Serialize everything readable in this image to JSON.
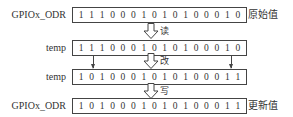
{
  "rows": [
    {
      "label": "GPIOx_ODR",
      "bits": [
        "1",
        "1",
        "1",
        "0",
        "0",
        "0",
        "1",
        "0",
        "1",
        "0",
        "1",
        "0",
        "0",
        "0",
        "1",
        "0"
      ],
      "side": "原始值"
    },
    {
      "label": "temp",
      "bits": [
        "1",
        "1",
        "1",
        "0",
        "0",
        "0",
        "1",
        "0",
        "1",
        "0",
        "1",
        "0",
        "0",
        "0",
        "1",
        "0"
      ],
      "side": ""
    },
    {
      "label": "temp",
      "bits": [
        "1",
        "0",
        "1",
        "0",
        "0",
        "0",
        "1",
        "0",
        "1",
        "0",
        "1",
        "0",
        "0",
        "0",
        "1",
        "1"
      ],
      "side": ""
    },
    {
      "label": "GPIOx_ODR",
      "bits": [
        "1",
        "0",
        "1",
        "0",
        "0",
        "0",
        "1",
        "0",
        "1",
        "0",
        "1",
        "0",
        "0",
        "0",
        "1",
        "1"
      ],
      "side": "更新值"
    }
  ],
  "steps": [
    {
      "label": "读",
      "icon": "hollow-down-arrow"
    },
    {
      "label": "改",
      "icon": "hollow-down-arrow"
    },
    {
      "label": "写",
      "icon": "hollow-down-arrow"
    }
  ],
  "colors": {
    "stroke": "#444444",
    "text": "#333333",
    "background": "#ffffff"
  }
}
